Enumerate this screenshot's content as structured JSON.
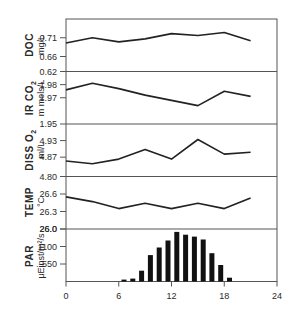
{
  "chart_data": {
    "type": "line",
    "title": "",
    "xlabel": "",
    "xlim": [
      0,
      24
    ],
    "x_ticks": [
      0,
      6,
      12,
      18,
      24
    ],
    "x_tick_labels": [
      "0",
      "6",
      "12",
      "18",
      "24"
    ],
    "panels": [
      {
        "id": "doc",
        "type": "line",
        "ylabel": "DOC",
        "yunit": "mg/L",
        "y_tick_labels": [
          "0.71",
          "0.66",
          "0.62"
        ],
        "y_ticks": [
          0.71,
          0.66,
          0.62
        ],
        "ylim": [
          0.62,
          0.76
        ],
        "x": [
          0,
          3,
          6,
          9,
          12,
          15,
          18,
          21
        ],
        "values": [
          0.696,
          0.71,
          0.699,
          0.707,
          0.721,
          0.716,
          0.724,
          0.702
        ]
      },
      {
        "id": "ir_co2",
        "type": "line",
        "ylabel": "IR CO2",
        "yunit": "m mols/L",
        "y_tick_labels": [
          "1.98",
          "1.97",
          "1.95"
        ],
        "y_ticks": [
          1.98,
          1.97,
          1.95
        ],
        "ylim": [
          1.95,
          1.99
        ],
        "x": [
          0,
          3,
          6,
          9,
          12,
          15,
          18,
          21
        ],
        "values": [
          1.976,
          1.981,
          1.977,
          1.972,
          1.968,
          1.964,
          1.975,
          1.971
        ]
      },
      {
        "id": "diss_o2",
        "type": "line",
        "ylabel": "DISS O2",
        "yunit": "ml/L",
        "y_tick_labels": [
          "4.93",
          "4.87",
          "4.80"
        ],
        "y_ticks": [
          4.93,
          4.87,
          4.8
        ],
        "ylim": [
          4.8,
          4.99
        ],
        "x": [
          0,
          3,
          6,
          9,
          12,
          15,
          18,
          21
        ],
        "values": [
          4.856,
          4.846,
          4.863,
          4.898,
          4.863,
          4.934,
          4.881,
          4.888
        ]
      },
      {
        "id": "temp",
        "type": "line",
        "ylabel": "TEMP",
        "yunit": "°C",
        "y_tick_labels": [
          "26.6",
          "26.3",
          "26.0"
        ],
        "y_ticks": [
          26.6,
          26.3,
          26.0
        ],
        "ylim": [
          26.0,
          26.9
        ],
        "x": [
          0,
          3,
          6,
          9,
          12,
          15,
          18,
          21
        ],
        "values": [
          26.55,
          26.47,
          26.35,
          26.44,
          26.35,
          26.44,
          26.35,
          26.53
        ]
      },
      {
        "id": "par",
        "type": "bar",
        "ylabel": "PAR",
        "yunit": "μEinst/m²/s",
        "y_tick_labels": [
          "26.0",
          "1100",
          "550"
        ],
        "y_ticks": [
          1650,
          1100,
          550
        ],
        "ylim": [
          0,
          1650
        ],
        "x": [
          6.1,
          7.1,
          8.1,
          9.1,
          10.1,
          11.1,
          12.1,
          13.1,
          14.1,
          15.1,
          16.1,
          17.1,
          18.1
        ],
        "values": [
          60,
          90,
          340,
          830,
          1070,
          1290,
          1560,
          1470,
          1410,
          1320,
          890,
          520,
          120
        ]
      }
    ]
  },
  "labels": {
    "doc_title": "DOC",
    "doc_unit": "mg/L",
    "co2_title": "IR CO",
    "co2_sub": "2",
    "co2_unit": "m mols/L",
    "o2_title": "DISS O",
    "o2_sub": "2",
    "o2_unit": "ml/L",
    "temp_title": "TEMP",
    "temp_unit": "°C",
    "par_title": "PAR",
    "par_unit": "μEinst/m²/s"
  }
}
